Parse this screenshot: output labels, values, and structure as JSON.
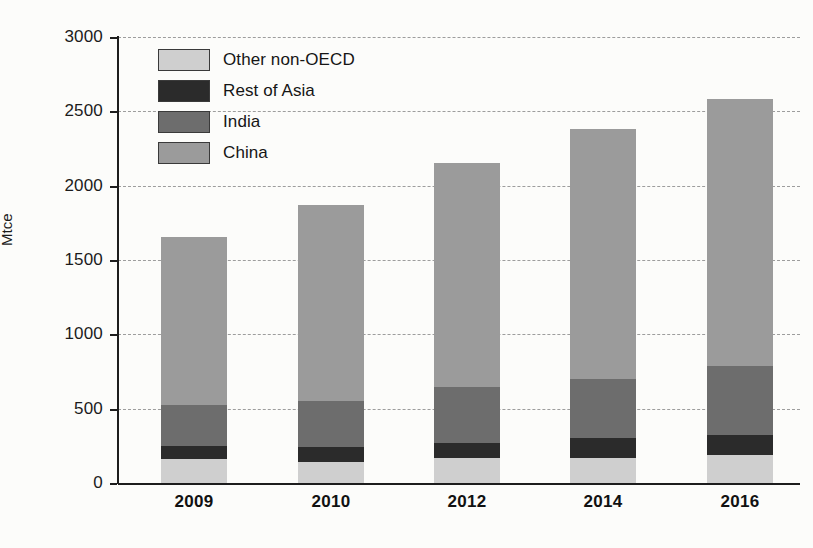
{
  "chart_data": {
    "type": "bar",
    "stacked": true,
    "title": "",
    "xlabel": "",
    "ylabel": "Mtce",
    "ylim": [
      0,
      3000
    ],
    "ytick_step": 500,
    "yticks": [
      0,
      500,
      1000,
      1500,
      2000,
      2500,
      3000
    ],
    "ytick_labels": [
      "0",
      "500",
      "1000",
      "1500",
      "2000",
      "2500",
      "3000"
    ],
    "categories": [
      "2009",
      "2010",
      "2012",
      "2014",
      "2016"
    ],
    "grid": "horizontal-dashed",
    "legend_position": "top-left-inside",
    "stack_order_bottom_to_top": [
      "Other non-OECD",
      "Rest of Asia",
      "India",
      "China"
    ],
    "series": [
      {
        "name": "Other non-OECD",
        "color": "#cfcfcf",
        "values": [
          160,
          140,
          165,
          170,
          190
        ]
      },
      {
        "name": "Rest of Asia",
        "color": "#2b2b2b",
        "values": [
          90,
          105,
          105,
          130,
          135
        ]
      },
      {
        "name": "India",
        "color": "#6d6d6d",
        "values": [
          275,
          305,
          375,
          400,
          465
        ]
      },
      {
        "name": "China",
        "color": "#9b9b9b",
        "values": [
          1130,
          1320,
          1505,
          1680,
          1790
        ]
      }
    ],
    "totals": [
      1655,
      1870,
      2150,
      2380,
      2580
    ]
  },
  "axis": {
    "y_title": "Mtce",
    "y_labels": [
      "3000",
      "2500",
      "2000",
      "1500",
      "1000",
      "500",
      "0"
    ],
    "x_labels": [
      "2009",
      "2010",
      "2012",
      "2014",
      "2016"
    ]
  },
  "legend": {
    "items": [
      {
        "label": "Other non-OECD",
        "color": "#cfcfcf"
      },
      {
        "label": "Rest of Asia",
        "color": "#2b2b2b"
      },
      {
        "label": "India",
        "color": "#6d6d6d"
      },
      {
        "label": "China",
        "color": "#9b9b9b"
      }
    ]
  },
  "colors": {
    "axis": "#1d1d1d",
    "grid": "#8d8d8d",
    "background": "#fcfcfa",
    "text": "#151515"
  }
}
